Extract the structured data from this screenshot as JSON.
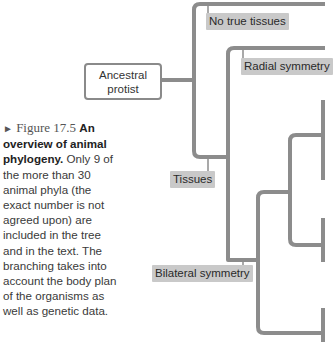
{
  "figure": {
    "number_label": "Figure 17.5",
    "title_bold": "An overview of animal phylogeny.",
    "caption_text": "Only 9 of the more than 30 animal phyla (the exact number is not agreed upon) are included in the tree and in the text. The branching takes into account the body plan of the organisms as well as genetic data."
  },
  "tree": {
    "root": {
      "line1": "Ancestral",
      "line2": "protist"
    },
    "labels": {
      "no_true_tissues": "No true tissues",
      "radial_symmetry": "Radial symmetry",
      "tissues": "Tissues",
      "bilateral_symmetry": "Bilateral symmetry"
    },
    "colors": {
      "branch": "#8c8c8c",
      "label_bg": "#c9c9c9",
      "text": "#2a2a2a"
    }
  }
}
